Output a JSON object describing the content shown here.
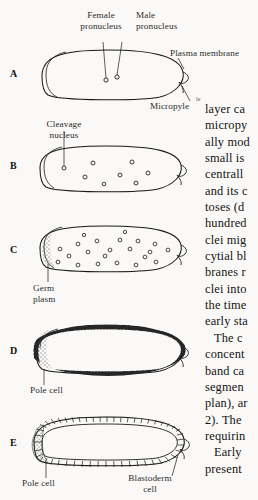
{
  "figure": {
    "title_alt": "Drosophila early embryogenesis stages A-E",
    "panels": [
      {
        "letter": "A",
        "name": "fertilized-egg"
      },
      {
        "letter": "B",
        "name": "cleavage-nuclei"
      },
      {
        "letter": "C",
        "name": "syncytial-nuclei-migration"
      },
      {
        "letter": "D",
        "name": "syncytial-blastoderm"
      },
      {
        "letter": "E",
        "name": "cellular-blastoderm"
      }
    ],
    "labels": {
      "female_pronucleus_l1": "Female",
      "female_pronucleus_l2": "pronucleus",
      "male_pronucleus_l1": "Male",
      "male_pronucleus_l2": "pronucleus",
      "plasma_membrane": "Plasma membrane",
      "micropyle": "Micropyle",
      "cleavage_nucleus_l1": "Cleavage",
      "cleavage_nucleus_l2": "nucleus",
      "germ_plasm_l1": "Germ",
      "germ_plasm_l2": "plasm",
      "pole_cell_d": "Pole cell",
      "pole_cell_e": "Pole cell",
      "blastoderm_cell_l1": "Blastoderm",
      "blastoderm_cell_l2": "cell"
    },
    "colors": {
      "ink": "#1a1a1a",
      "label_ink": "#2b2b2b",
      "paper": "#faf9f7",
      "stipple": "#3a3a3a"
    }
  },
  "body_text": {
    "fragment_above": "le",
    "lines": [
      {
        "text": "layer ca",
        "indent": false
      },
      {
        "text": "micropy",
        "indent": false
      },
      {
        "text": "ally mod",
        "indent": false
      },
      {
        "text": "small is",
        "indent": false
      },
      {
        "text": "centrall",
        "indent": false
      },
      {
        "text": "and its c",
        "indent": false
      },
      {
        "text": "toses (d",
        "indent": false
      },
      {
        "text": "hundred",
        "indent": false
      },
      {
        "text": "clei mig",
        "indent": false
      },
      {
        "text": "cytial bl",
        "indent": false
      },
      {
        "text": "branes r",
        "indent": false
      },
      {
        "text": "clei into",
        "indent": false
      },
      {
        "text": "the time",
        "indent": false
      },
      {
        "text": "early sta",
        "indent": false
      },
      {
        "text": "The c",
        "indent": true
      },
      {
        "text": "concent",
        "indent": false
      },
      {
        "text": "band ca",
        "indent": false
      },
      {
        "text": "segmen",
        "indent": false
      },
      {
        "text": "plan), ar",
        "indent": false
      },
      {
        "text": "2). The",
        "indent": false
      },
      {
        "text": "requirin",
        "indent": false
      },
      {
        "text": "Early",
        "indent": true
      },
      {
        "text": "present",
        "indent": false
      }
    ]
  }
}
